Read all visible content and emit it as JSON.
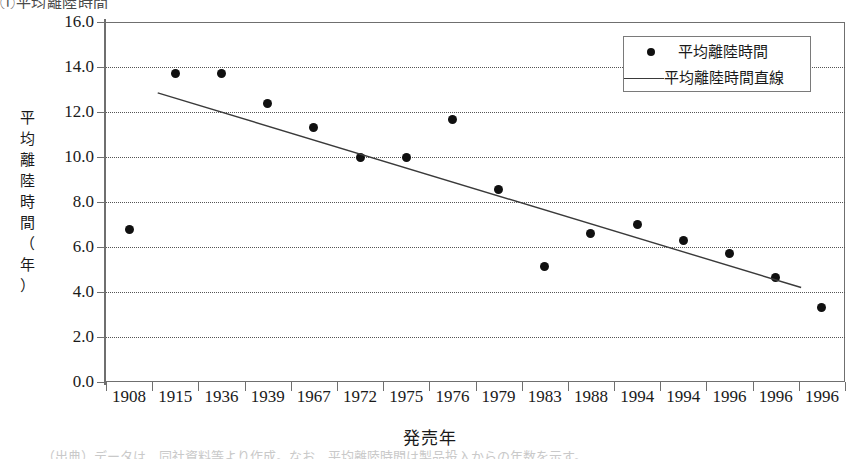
{
  "title_fragment": "①平均離陸時間",
  "caption_fragment": "（出典）データは、同社資料等より作成。なお、平均離陸時間は製品投入からの年数を示す。",
  "axes": {
    "y_title_chars": [
      "平",
      "均",
      "離",
      "陸",
      "時",
      "間",
      "（",
      "年",
      "）"
    ],
    "y_title_text": "平均離陸時間（年）",
    "x_title": "発売年"
  },
  "legend": {
    "items": [
      {
        "label": "平均離陸時間",
        "marker": "dot-marker",
        "color": "#101010"
      },
      {
        "label": "平均離陸時間直線",
        "marker": "line-marker",
        "color": "#3a3a3a"
      }
    ]
  },
  "chart_data": {
    "type": "scatter",
    "title": "平均離陸時間",
    "xlabel": "発売年",
    "ylabel": "平均離陸時間（年）",
    "categories": [
      "1908",
      "1915",
      "1936",
      "1939",
      "1967",
      "1972",
      "1975",
      "1976",
      "1979",
      "1983",
      "1988",
      "1994",
      "1994",
      "1996",
      "1996",
      "1996"
    ],
    "ytick_labels": [
      "0.0",
      "2.0",
      "4.0",
      "6.0",
      "8.0",
      "10.0",
      "12.0",
      "14.0",
      "16.0"
    ],
    "ylim": [
      0.0,
      16.0
    ],
    "ytick_step": 2.0,
    "grid": "horizontal-dotted",
    "legend_position": "top-right",
    "series": [
      {
        "name": "平均離陸時間",
        "type": "scatter",
        "values": [
          6.8,
          13.7,
          13.7,
          12.4,
          11.3,
          10.0,
          10.0,
          11.65,
          8.55,
          5.15,
          6.6,
          7.0,
          6.3,
          5.7,
          4.65,
          3.3
        ]
      },
      {
        "name": "平均離陸時間直線",
        "type": "line",
        "fit": "linear-trend",
        "endpoints": [
          {
            "x_index": 0.62,
            "y": 12.85
          },
          {
            "x_index": 14.55,
            "y": 4.2
          }
        ]
      }
    ]
  }
}
